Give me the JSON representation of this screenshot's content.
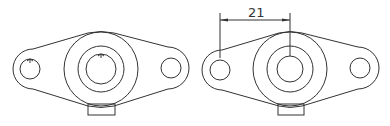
{
  "figure": {
    "line_color": "#333333",
    "background": "#ffffff",
    "views": [
      {
        "name": "left-view",
        "center_boss": {
          "cx": 101,
          "cy": 69,
          "outer_r": 37,
          "middle_r": 23,
          "inner_r": 15
        },
        "holes": [
          {
            "cx": 30,
            "cy": 69,
            "r": 10
          },
          {
            "cx": 171,
            "cy": 68,
            "r": 10
          }
        ],
        "tab": {
          "x": 88,
          "y": 104,
          "w": 27,
          "h": 11
        }
      },
      {
        "name": "right-view",
        "center_boss": {
          "cx": 290,
          "cy": 69,
          "outer_r": 37,
          "middle_r": 23,
          "inner_r": 13
        },
        "holes": [
          {
            "cx": 220,
            "cy": 70,
            "r": 10
          },
          {
            "cx": 360,
            "cy": 68,
            "r": 10
          }
        ],
        "tab": {
          "x": 278,
          "y": 104,
          "w": 26,
          "h": 11
        }
      }
    ],
    "dimension": {
      "label": "21",
      "from_x": 220,
      "to_x": 290,
      "line_y": 20
    }
  }
}
